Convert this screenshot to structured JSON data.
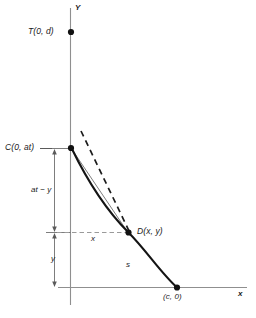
{
  "figure": {
    "type": "geometry-diagram",
    "axes": {
      "x_label": "x",
      "y_label": "Y"
    },
    "points": [
      {
        "id": "T",
        "label": "T(0, d)",
        "px": 71,
        "py": 32
      },
      {
        "id": "C",
        "label": "C(0, at)",
        "px": 71,
        "py": 148
      },
      {
        "id": "D",
        "label": "D(x, y)",
        "px": 128,
        "py": 232
      },
      {
        "id": "E",
        "label": "(c, 0)",
        "px": 177,
        "py": 287
      }
    ],
    "measures": {
      "upper_segment": "at − y",
      "lower_segment": "y",
      "horizontal_segment": "x",
      "arc_length": "s"
    },
    "colors": {
      "curve": "#141414",
      "axis": "#8a8a8a",
      "guide": "#9a9a9a",
      "text": "#1a1a1a"
    }
  }
}
